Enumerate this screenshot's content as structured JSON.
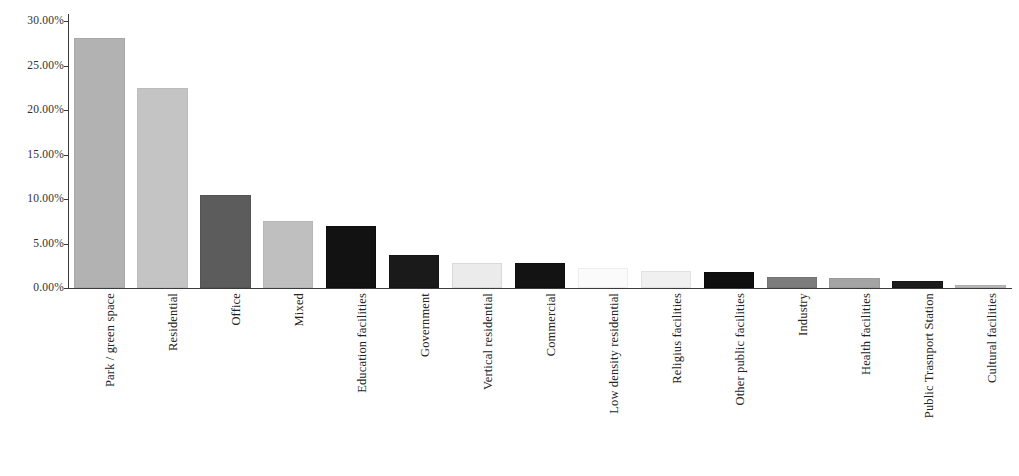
{
  "chart_data": {
    "type": "bar",
    "title": "",
    "subtitle": "",
    "xlabel": "",
    "ylabel": "",
    "ylim": [
      0,
      30
    ],
    "y_tick_labels": [
      "0.00%",
      "5.00%",
      "10.00%",
      "15.00%",
      "20.00%",
      "25.00%",
      "30.00%"
    ],
    "y_tick_values": [
      0,
      5,
      10,
      15,
      20,
      25,
      30
    ],
    "grid": false,
    "legend": "none",
    "value_suffix": "%",
    "categories": [
      "Park / green space",
      "Residential",
      "Office",
      "Mixed",
      "Education facilities",
      "Government",
      "Vertical residential",
      "Commercial",
      "Low density residential",
      "Religius facilities",
      "Other public facilities",
      "Industry",
      "Health facilities",
      "Public Trasnport Station",
      "Cultural facilities"
    ],
    "values": [
      28.1,
      22.5,
      10.5,
      7.5,
      7.0,
      3.7,
      2.8,
      2.8,
      2.2,
      1.9,
      1.8,
      1.2,
      1.1,
      0.8,
      0.35
    ],
    "bar_colors": [
      "#b2b2b2",
      "#c4c4c4",
      "#5c5c5c",
      "#bfbfbf",
      "#121212",
      "#1a1a1a",
      "#ebebeb",
      "#131313",
      "#fbfbfb",
      "#f0f0f0",
      "#0f0f0f",
      "#7c7c7c",
      "#a4a4a4",
      "#1c1c1c",
      "#b8b8b8"
    ],
    "bar_border_colors": [
      "#a8a8a8",
      "#bcbcbc",
      "#545454",
      "#b6b6b6",
      "#0d0d0d",
      "#141414",
      "#d9d9d9",
      "#0e0e0e",
      "#ededed",
      "#e2e2e2",
      "#0a0a0a",
      "#747474",
      "#9a9a9a",
      "#161616",
      "#aeaeae"
    ]
  },
  "axis": {
    "axis_color": "#3a3a3a",
    "tick_font_size": "11.5px"
  }
}
